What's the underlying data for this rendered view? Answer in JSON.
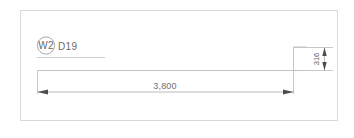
{
  "drawing": {
    "title": "",
    "frame": {
      "border_color": "#d8d8d8",
      "background": "#ffffff"
    },
    "colors": {
      "geometry_line": "#b9b9b9",
      "dimension_line": "#b0b0b0",
      "extension_line": "#c2c2c2",
      "text": "#6a6a6a",
      "arrow": "#4a4a4a",
      "tag_circle": "#9a9a9a",
      "underline": "#c9c9c9"
    },
    "tag": {
      "circle_label": "W2",
      "member_label": "D19"
    },
    "dimensions": [
      {
        "name": "span-dimension",
        "value": "3,800",
        "orientation": "horizontal",
        "arrow_style": "filled-tick"
      },
      {
        "name": "depth-dimension",
        "value": "316",
        "orientation": "vertical",
        "arrow_style": "filled-tick"
      }
    ]
  }
}
